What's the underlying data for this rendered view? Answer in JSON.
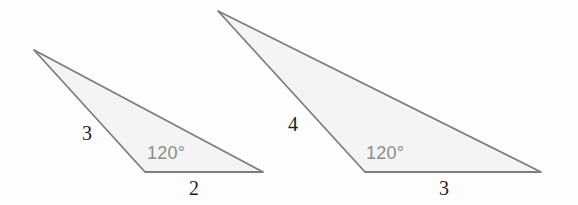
{
  "figure": {
    "kind": "geometry-diagram",
    "background_color": "#fdfdfd",
    "stroke_color": "#7d7d7d",
    "fill_color": "#f4f4f4",
    "side_label_color": "#1d1d1d",
    "angle_label_color": "#8d8d8d",
    "stroke_width": 1.8
  },
  "chart_data": {
    "type": "diagram",
    "title": "",
    "shapes": [
      {
        "name": "small-triangle",
        "points": [
          [
            34,
            50
          ],
          [
            145,
            172
          ],
          [
            263,
            172
          ]
        ],
        "side_labels": [
          "3",
          "2"
        ],
        "angle_labels": [
          "120°"
        ]
      },
      {
        "name": "large-triangle",
        "points": [
          [
            218,
            11
          ],
          [
            365,
            172
          ],
          [
            541,
            172
          ]
        ],
        "side_labels": [
          "4",
          "3"
        ],
        "angle_labels": [
          "120°"
        ]
      }
    ]
  },
  "triangles": {
    "small": {
      "name": "small-triangle",
      "polygon_points": "34,50 145,172 263,172",
      "labels": {
        "left_side": "3",
        "base": "2",
        "angle": "120°"
      },
      "label_positions": {
        "left_side": {
          "left": "82px",
          "top": "123px"
        },
        "base": {
          "left": "189px",
          "top": "178px"
        },
        "angle": {
          "left": "147px",
          "top": "144px"
        }
      }
    },
    "large": {
      "name": "large-triangle",
      "polygon_points": "218,11 365,172 541,172",
      "labels": {
        "left_side": "4",
        "base": "3",
        "angle": "120°"
      },
      "label_positions": {
        "left_side": {
          "left": "288px",
          "top": "114px"
        },
        "base": {
          "left": "439px",
          "top": "178px"
        },
        "angle": {
          "left": "366px",
          "top": "144px"
        }
      }
    }
  }
}
